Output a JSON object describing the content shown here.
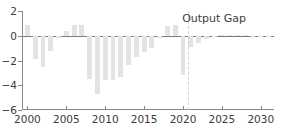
{
  "chart_data": {
    "type": "bar",
    "title": "Output Gap",
    "xlabel": "",
    "ylabel": "",
    "xlim": [
      1999.3,
      2031.7
    ],
    "ylim": [
      -6,
      2
    ],
    "grid": false,
    "legend_position": "top-right-inside",
    "xticks": [
      2000,
      2005,
      2010,
      2015,
      2020,
      2025,
      2030
    ],
    "xtick_labels": [
      "2000",
      "2005",
      "2010",
      "2015",
      "2020",
      "2025",
      "2030"
    ],
    "yticks": [
      2,
      0,
      -2,
      -4,
      -6
    ],
    "ytick_labels": [
      "2",
      "0",
      "−2",
      "−4",
      "−6"
    ],
    "bar_color": "#e3e3e3",
    "axis_color": "#8a8a8a",
    "forecast_start": 2020.6,
    "forecast_line_color": "#d2d2d2",
    "annotations": [
      {
        "text": "Output Gap",
        "x": 2024.0,
        "y": 1.45
      }
    ],
    "categories": [
      2000,
      2001,
      2002,
      2003,
      2004,
      2005,
      2006,
      2007,
      2008,
      2009,
      2010,
      2011,
      2012,
      2013,
      2014,
      2015,
      2016,
      2017,
      2018,
      2019,
      2020,
      2021,
      2022,
      2023,
      2024,
      2025,
      2026,
      2027,
      2028,
      2029,
      2030,
      2031
    ],
    "values": [
      0.9,
      -1.9,
      -2.5,
      -1.2,
      -0.15,
      0.4,
      0.85,
      0.85,
      -3.5,
      -4.7,
      -3.6,
      -3.55,
      -3.3,
      -2.4,
      -1.75,
      -1.3,
      -1.0,
      -0.2,
      0.75,
      0.85,
      -3.2,
      -0.9,
      -0.55,
      -0.25,
      -0.05,
      0.05,
      0.08,
      0.05,
      0.03,
      0.02,
      0.02,
      0.02
    ],
    "series": [
      {
        "name": "Output Gap",
        "values": [
          0.9,
          -1.9,
          -2.5,
          -1.2,
          -0.15,
          0.4,
          0.85,
          0.85,
          -3.5,
          -4.7,
          -3.6,
          -3.55,
          -3.3,
          -2.4,
          -1.75,
          -1.3,
          -1.0,
          -0.2,
          0.75,
          0.85,
          -3.2,
          -0.9,
          -0.55,
          -0.25,
          -0.05,
          0.05,
          0.08,
          0.05,
          0.03,
          0.02,
          0.02,
          0.02
        ]
      }
    ]
  }
}
